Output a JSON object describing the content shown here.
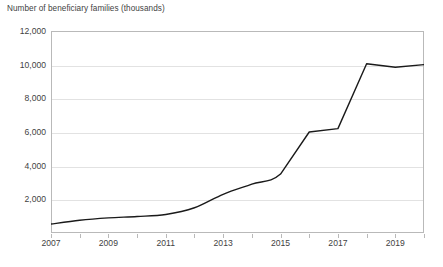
{
  "chart_data": {
    "type": "line",
    "title": "",
    "ylabel": "Number of beneficiary families (thousands)",
    "xlabel": "",
    "ylim": [
      0,
      12000
    ],
    "xlim": [
      2007,
      2020
    ],
    "grid": true,
    "legend": false,
    "line_color": "#1a1a1a",
    "smoothing": true,
    "x": [
      2007,
      2008,
      2009,
      2010,
      2011,
      2012,
      2013,
      2014,
      2015,
      2016,
      2017,
      2018,
      2019,
      2020
    ],
    "categories": [
      "2007",
      "2008",
      "2009",
      "2010",
      "2011",
      "2012",
      "2013",
      "2014",
      "2015",
      "2016",
      "2017",
      "2018",
      "2019",
      "2020"
    ],
    "series": [
      {
        "name": "Beneficiary families",
        "values": [
          530,
          760,
          900,
          980,
          1100,
          1500,
          2300,
          2900,
          3500,
          6000,
          6200,
          10050,
          9850,
          10000
        ]
      }
    ],
    "values": [
      530,
      760,
      900,
      980,
      1100,
      1500,
      2300,
      2900,
      3500,
      6000,
      6200,
      10050,
      9850,
      10000
    ],
    "ytick_labels": [
      "12,000",
      "10,000",
      "8,000",
      "6,000",
      "4,000",
      "2,000"
    ],
    "ytick_values": [
      12000,
      10000,
      8000,
      6000,
      4000,
      2000
    ],
    "xtick_labels": [
      "2007",
      "2009",
      "2011",
      "2013",
      "2015",
      "2017",
      "2019"
    ],
    "xtick_values": [
      2007,
      2009,
      2011,
      2013,
      2015,
      2017,
      2019
    ],
    "xtick_minor_values": [
      2008,
      2010,
      2012,
      2014,
      2016,
      2018,
      2020
    ]
  }
}
